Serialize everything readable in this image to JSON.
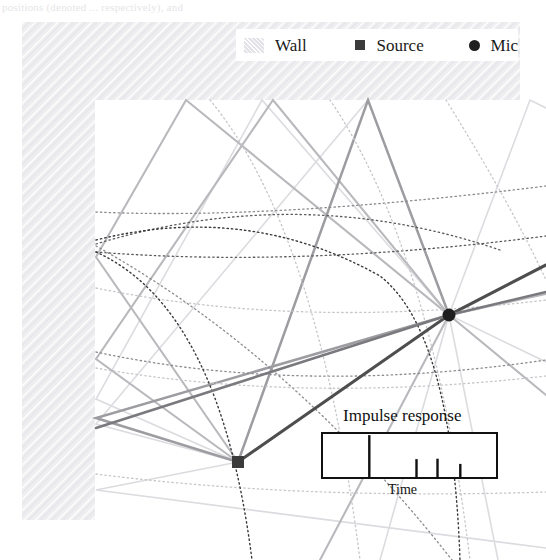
{
  "page": {
    "caption_fragment": "positions (denoted ... respectively), and",
    "width": 546,
    "height": 560
  },
  "legend": {
    "items": [
      {
        "label": "Wall",
        "icon": "wall-hatch-swatch",
        "color": "#eeeef0"
      },
      {
        "label": "Source",
        "icon": "filled-square-marker",
        "color": "#3b3b3b"
      },
      {
        "label": "Mic",
        "icon": "filled-circle-marker",
        "color": "#1f1f1f"
      }
    ]
  },
  "room": {
    "wall_color": "#eeeef0",
    "wall_hatch_color": "#e1e1e6",
    "top_wall": {
      "x": 22,
      "y": 22,
      "width": 498,
      "height": 78
    },
    "left_wall": {
      "x": 22,
      "y": 22,
      "width": 73,
      "height": 498
    },
    "interior_corner": {
      "x": 95,
      "y": 100
    },
    "source": {
      "x": 238,
      "y": 462,
      "label": "Source",
      "color": "#3b3b3b",
      "size": 12
    },
    "mic": {
      "x": 449,
      "y": 315,
      "label": "Mic",
      "color": "#1f1f1f",
      "radius": 6.5
    }
  },
  "chart_data": {
    "type": "line",
    "title": "Impulse response",
    "xlabel": "Time",
    "ylabel": "",
    "plot_box": {
      "x": 322,
      "y": 433,
      "width": 175,
      "height": 45
    },
    "grid": false,
    "legend_position": "top",
    "series": [
      {
        "name": "Impulse response taps",
        "x": [
          0.27,
          0.54,
          0.66,
          0.79
        ],
        "values": [
          1.0,
          0.44,
          0.45,
          0.33
        ],
        "color": "#111111"
      }
    ],
    "xlim": [
      0,
      1
    ],
    "ylim": [
      0,
      1.05
    ],
    "annotations": [
      {
        "text": "Direct path arrival",
        "x": 0.27
      },
      {
        "text": "Early reflections",
        "x": 0.66
      }
    ]
  },
  "rays": {
    "description": "Acoustic ray paths from source reflecting off walls to mic",
    "colors": {
      "direct": "#4a4a4a",
      "first_order": "#8c8c8c",
      "second_order": "#b4b4b4",
      "higher_order": "#d4d4d8"
    },
    "wavefront_style": "dotted",
    "count": 9
  }
}
